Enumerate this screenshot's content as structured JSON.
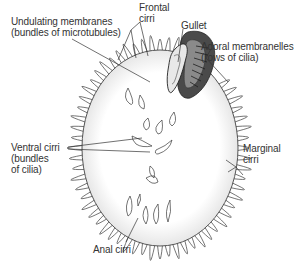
{
  "diagram": {
    "labels": {
      "undulating_line1": "Undulating membranes",
      "undulating_line2": "(bundles of microtubules)",
      "frontal_line1": "Frontal",
      "frontal_line2": "cirri",
      "gullet": "Gullet",
      "adoral_line1": "Adoral membranelles",
      "adoral_line2": "(rows of cilia)",
      "ventral_line1": "Ventral cirri",
      "ventral_line2": "(bundles",
      "ventral_line3": "of cilia)",
      "marginal_line1": "Marginal",
      "marginal_line2": "cirri",
      "anal": "Anal cirri"
    },
    "colors": {
      "outline": "#3a3a3a",
      "gullet_dark": "#2b2b2b",
      "gullet_mid": "#6a6a6a",
      "shading": "#e6e6e6"
    }
  }
}
